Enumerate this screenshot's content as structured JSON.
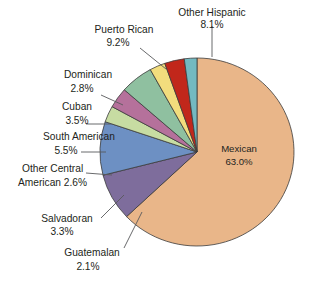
{
  "chart_data": {
    "type": "pie",
    "title": "",
    "subtitle": "",
    "xlabel": "",
    "ylabel": "",
    "legend_position": "none",
    "grid": false,
    "units": "percent",
    "start_angle_deg": 0,
    "direction": "clockwise",
    "categories": [
      "Mexican",
      "Other Hispanic",
      "Puerto Rican",
      "Dominican",
      "Cuban",
      "South American",
      "Other Central American",
      "Salvadoran",
      "Guatemalan"
    ],
    "values": [
      63.0,
      8.1,
      9.2,
      2.8,
      3.5,
      5.5,
      2.6,
      3.3,
      2.1
    ],
    "colors": [
      "#e9b689",
      "#7e6d9c",
      "#6d90c3",
      "#c7dca2",
      "#b5719b",
      "#8fc0a0",
      "#f2dd7d",
      "#c1271b",
      "#73b9c1"
    ],
    "slices": [
      {
        "label": "Mexican",
        "value": 63.0,
        "value_text": "63.0%",
        "color": "#e9b689",
        "label_placement": "inside"
      },
      {
        "label": "Other Hispanic",
        "value": 8.1,
        "value_text": "8.1%",
        "color": "#7e6d9c",
        "label_placement": "outside"
      },
      {
        "label": "Puerto Rican",
        "value": 9.2,
        "value_text": "9.2%",
        "color": "#6d90c3",
        "label_placement": "outside"
      },
      {
        "label": "Dominican",
        "value": 2.8,
        "value_text": "2.8%",
        "color": "#c7dca2",
        "label_placement": "outside"
      },
      {
        "label": "Cuban",
        "value": 3.5,
        "value_text": "3.5%",
        "color": "#b5719b",
        "label_placement": "outside"
      },
      {
        "label": "South American",
        "value": 5.5,
        "value_text": "5.5%",
        "color": "#8fc0a0",
        "label_placement": "outside"
      },
      {
        "label": "Other Central American",
        "value": 2.6,
        "value_text": "2.6%",
        "color": "#f2dd7d",
        "label_placement": "outside"
      },
      {
        "label": "Salvadoran",
        "value": 3.3,
        "value_text": "3.3%",
        "color": "#c1271b",
        "label_placement": "outside"
      },
      {
        "label": "Guatemalan",
        "value": 2.1,
        "value_text": "2.1%",
        "color": "#73b9c1",
        "label_placement": "outside"
      }
    ]
  },
  "labels": {
    "mexican_name": "Mexican",
    "mexican_value": "63.0%",
    "other_hispanic_name": "Other Hispanic",
    "other_hispanic_value": "8.1%",
    "puerto_rican_name": "Puerto Rican",
    "puerto_rican_value": "9.2%",
    "dominican_name": "Dominican",
    "dominican_value": "2.8%",
    "cuban_name": "Cuban",
    "cuban_value": "3.5%",
    "south_american_name": "South American",
    "south_american_value": "5.5%",
    "other_central_line1": "Other Central",
    "other_central_line2": "American 2.6%",
    "salvadoran_name": "Salvadoran",
    "salvadoran_value": "3.3%",
    "guatemalan_name": "Guatemalan",
    "guatemalan_value": "2.1%"
  },
  "style": {
    "background": "#ffffff",
    "slice_border": "#3b3b3b",
    "leader_line": "#58595b",
    "text_color": "#231f20"
  }
}
